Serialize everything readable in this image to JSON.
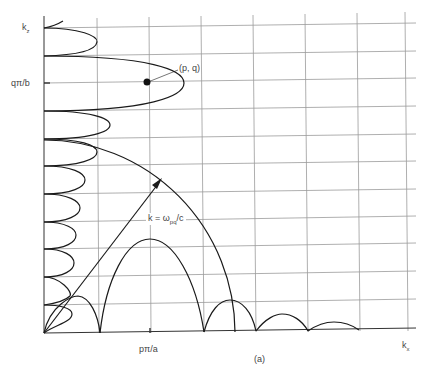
{
  "figure": {
    "caption": "(a)",
    "axes": {
      "x_label": "k",
      "x_label_sub": "x",
      "y_label": "k",
      "y_label_sub": "z",
      "x_tick_label": "pπ/a",
      "y_tick_label": "qπ/b"
    },
    "annotations": {
      "point_label": "(p, q)",
      "wavevector_label": "k = ω",
      "wavevector_sub": "pq",
      "wavevector_suffix": "/c"
    },
    "colors": {
      "background": "#ffffff",
      "grid": "#9a9a9a",
      "curve": "#1a1a1a",
      "text": "#444444"
    },
    "grid": {
      "origin_px": [
        44,
        333
      ],
      "columns": 7,
      "rows": 11,
      "cell_w": 52,
      "cell_h": 27.7
    }
  }
}
